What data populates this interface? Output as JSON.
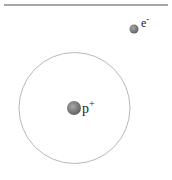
{
  "diagram": {
    "proton": {
      "label": "p",
      "charge": "+",
      "color": "#7a7a7a"
    },
    "electron": {
      "label": "e",
      "charge": "-",
      "color": "#7a7a7a"
    },
    "orbit": {
      "stroke": "#b0b0b0"
    },
    "top_rule": {
      "stroke": "#8a8a8a"
    }
  }
}
